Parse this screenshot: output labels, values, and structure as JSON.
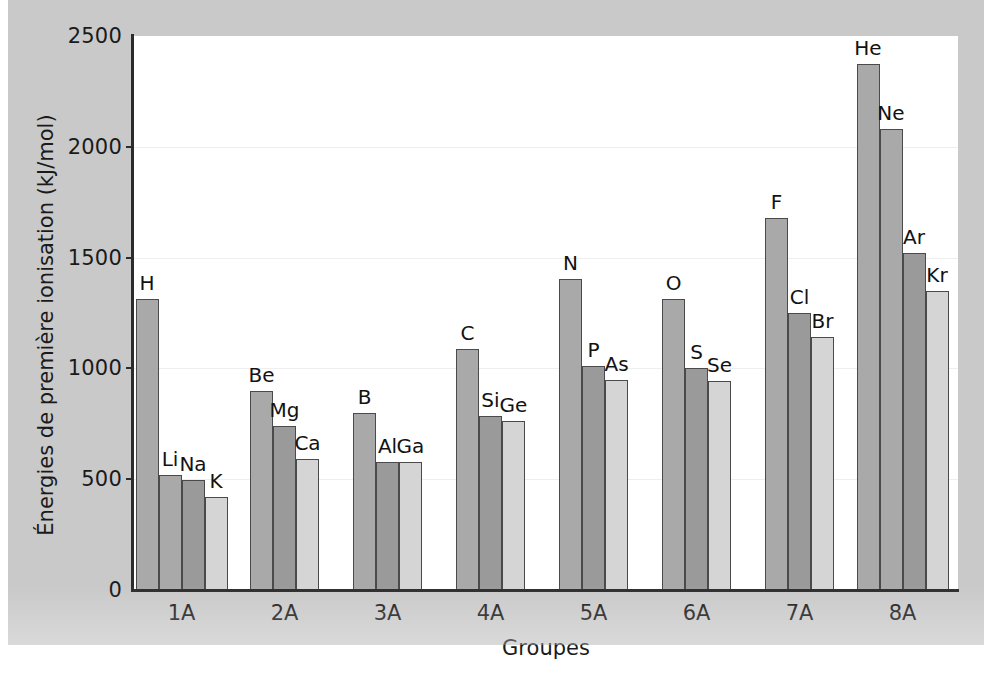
{
  "chart_data": {
    "type": "bar",
    "title": "",
    "xlabel": "Groupes",
    "ylabel": "Énergies de première ionisation (kJ/mol)",
    "ylim": [
      0,
      2500
    ],
    "yticks": [
      0,
      500,
      1000,
      1500,
      2000,
      2500
    ],
    "ytick_labels": [
      "0",
      "500",
      "1000",
      "1500",
      "2000",
      "2500"
    ],
    "grid": true,
    "legend": "none",
    "categories": [
      "1A",
      "2A",
      "3A",
      "4A",
      "5A",
      "6A",
      "7A",
      "8A"
    ],
    "groups": [
      {
        "category": "1A",
        "bars": [
          {
            "label": "H",
            "value": 1312,
            "shade": "#a9a9a9"
          },
          {
            "label": "Li",
            "value": 520,
            "shade": "#a9a9a9"
          },
          {
            "label": "Na",
            "value": 496,
            "shade": "#9a9a9a"
          },
          {
            "label": "K",
            "value": 419,
            "shade": "#d5d5d5"
          }
        ]
      },
      {
        "category": "2A",
        "bars": [
          {
            "label": "Be",
            "value": 899,
            "shade": "#a9a9a9"
          },
          {
            "label": "Mg",
            "value": 738,
            "shade": "#9a9a9a"
          },
          {
            "label": "Ca",
            "value": 590,
            "shade": "#d5d5d5"
          }
        ]
      },
      {
        "category": "3A",
        "bars": [
          {
            "label": "B",
            "value": 801,
            "shade": "#a9a9a9"
          },
          {
            "label": "Al",
            "value": 578,
            "shade": "#9a9a9a"
          },
          {
            "label": "Ga",
            "value": 579,
            "shade": "#d5d5d5"
          }
        ]
      },
      {
        "category": "4A",
        "bars": [
          {
            "label": "C",
            "value": 1086,
            "shade": "#a9a9a9"
          },
          {
            "label": "Si",
            "value": 786,
            "shade": "#9a9a9a"
          },
          {
            "label": "Ge",
            "value": 762,
            "shade": "#d5d5d5"
          }
        ]
      },
      {
        "category": "5A",
        "bars": [
          {
            "label": "N",
            "value": 1402,
            "shade": "#a9a9a9"
          },
          {
            "label": "P",
            "value": 1012,
            "shade": "#9a9a9a"
          },
          {
            "label": "As",
            "value": 947,
            "shade": "#d5d5d5"
          }
        ]
      },
      {
        "category": "6A",
        "bars": [
          {
            "label": "O",
            "value": 1314,
            "shade": "#a9a9a9"
          },
          {
            "label": "S",
            "value": 1000,
            "shade": "#9a9a9a"
          },
          {
            "label": "Se",
            "value": 941,
            "shade": "#d5d5d5"
          }
        ]
      },
      {
        "category": "7A",
        "bars": [
          {
            "label": "F",
            "value": 1681,
            "shade": "#a9a9a9"
          },
          {
            "label": "Cl",
            "value": 1251,
            "shade": "#9a9a9a"
          },
          {
            "label": "Br",
            "value": 1140,
            "shade": "#d5d5d5"
          }
        ]
      },
      {
        "category": "8A",
        "bars": [
          {
            "label": "He",
            "value": 2372,
            "shade": "#a9a9a9"
          },
          {
            "label": "Ne",
            "value": 2081,
            "shade": "#a9a9a9"
          },
          {
            "label": "Ar",
            "value": 1521,
            "shade": "#9a9a9a"
          },
          {
            "label": "Kr",
            "value": 1351,
            "shade": "#d5d5d5"
          }
        ]
      }
    ],
    "colors": {
      "figure_background": "#c9c9c9",
      "plot_background": "#ffffff",
      "axis": "#2b2b2b",
      "bar_outline": "#4a4a4a",
      "gridline": "#eeeeee",
      "text": "#1a1a1a"
    }
  }
}
